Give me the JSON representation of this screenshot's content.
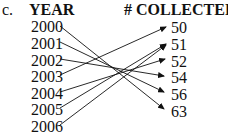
{
  "label": "c.",
  "headers": {
    "left": "YEAR",
    "right": "# COLLECTED"
  },
  "years": [
    "2000",
    "2001",
    "2002",
    "2003",
    "2004",
    "2005",
    "2006"
  ],
  "collected": [
    "50",
    "51",
    "52",
    "54",
    "56",
    "63"
  ],
  "mappings": [
    {
      "from": "2000",
      "to": "63"
    },
    {
      "from": "2001",
      "to": "56"
    },
    {
      "from": "2002",
      "to": "54"
    },
    {
      "from": "2003",
      "to": "50"
    },
    {
      "from": "2004",
      "to": "52"
    },
    {
      "from": "2005",
      "to": "51"
    },
    {
      "from": "2006",
      "to": "51"
    }
  ]
}
